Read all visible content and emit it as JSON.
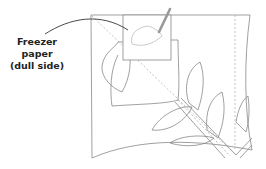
{
  "diagram": {
    "callout": {
      "lines": [
        "Freezer",
        "paper",
        "(dull side)"
      ]
    },
    "elements": [
      "fabric-square",
      "freezer-paper-template",
      "pencil",
      "tulip-flower",
      "leaves",
      "stem",
      "fold-guide-lines"
    ],
    "colors": {
      "outline": "#888888",
      "callout_line": "#333333",
      "pencil": "#9a9a9a",
      "dashed": "#aaaaaa"
    }
  }
}
